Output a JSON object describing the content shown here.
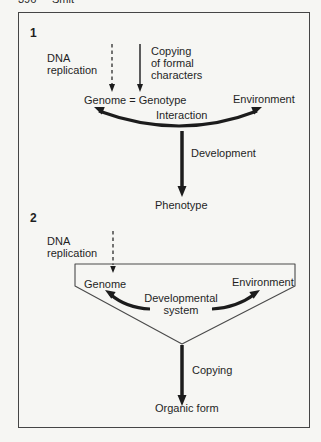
{
  "page_header": {
    "number": "396",
    "title": "Smit"
  },
  "colors": {
    "background": "#f6f6f3",
    "ink": "#1c1c1c",
    "border": "#454545",
    "funnel_stroke": "#4a4a4a"
  },
  "diagram1": {
    "number": "1",
    "dna_replication": "DNA\nreplication",
    "copying_of_formal_characters": "Copying\nof formal\ncharacters",
    "genome_genotype": "Genome = Genotype",
    "environment": "Environment",
    "interaction": "Interaction",
    "development": "Development",
    "phenotype": "Phenotype"
  },
  "diagram2": {
    "number": "2",
    "dna_replication": "DNA\nreplication",
    "genome": "Genome",
    "environment": "Environment",
    "developmental_system": "Developmental\nsystem",
    "copying": "Copying",
    "organic_form": "Organic form"
  }
}
